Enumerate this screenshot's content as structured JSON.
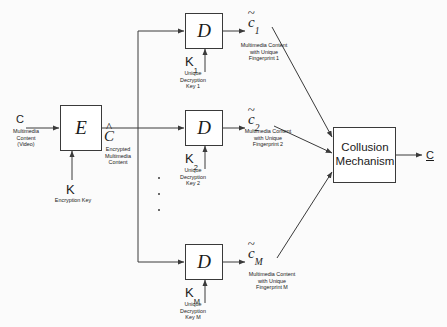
{
  "diagram": {
    "canvas": {
      "width": 447,
      "height": 327,
      "background": "#fbfbfb"
    },
    "stroke_color": "#3a3a3a",
    "text_color": "#1a1a1a"
  },
  "input": {
    "symbol": "C",
    "caption": "Multimedia\nContent\n(Video)"
  },
  "encryptor": {
    "label": "E",
    "key_symbol": "K",
    "key_caption": "Encryption Key",
    "output_symbol": "C",
    "output_accent": "^",
    "output_caption": "Encrypted\nMultimedia\nContent"
  },
  "branches": [
    {
      "decryptor_label": "D",
      "key_symbol": "K",
      "key_subscript": "1",
      "key_caption": "Unique\nDecryption\nKey 1",
      "out_symbol": "c",
      "out_accent": "~",
      "out_subscript": "1",
      "out_caption": "Multimedia Content\nwith Unique\nFingerprint 1"
    },
    {
      "decryptor_label": "D",
      "key_symbol": "K",
      "key_subscript": "2",
      "key_caption": "Unique\nDecryption\nKey 2",
      "out_symbol": "c",
      "out_accent": "~",
      "out_subscript": "2",
      "out_caption": "Multimedia Content\nwith Unique\nFingerprint 2"
    },
    {
      "decryptor_label": "D",
      "key_symbol": "K",
      "key_subscript": "M",
      "key_caption": "Unique\nDecryption\nKey M",
      "out_symbol": "c",
      "out_accent": "~",
      "out_subscript": "M",
      "out_caption": "Multimedia Content\nwith Unique\nFingerprint M"
    }
  ],
  "ellipsis": {
    "glyph": "·",
    "count": 3
  },
  "collusion": {
    "line1": "Collusion",
    "line2": "Mechanism",
    "output_symbol": "C"
  }
}
